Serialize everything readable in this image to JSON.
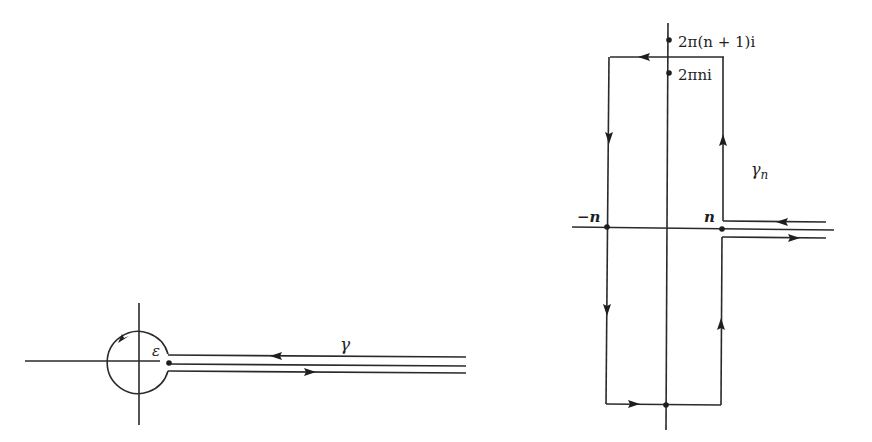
{
  "figure": {
    "left_panel": {
      "title": "Keyhole contour around origin",
      "labels": {
        "epsilon": "ε",
        "gamma": "γ"
      }
    },
    "right_panel": {
      "title": "Rectangular contour with slit along positive real axis",
      "labels": {
        "top_point": "2π(n + 1)i",
        "upper_point": "2πni",
        "neg_n": "−n",
        "pos_n": "n",
        "gamma_n": "γ",
        "gamma_n_sub": "n"
      }
    }
  }
}
